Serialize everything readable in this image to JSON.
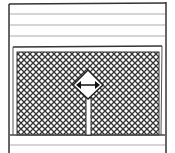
{
  "figure": {
    "handle_icon": "horizontal-resize-arrows-icon"
  },
  "colors": {
    "stroke": "#333333",
    "light_line": "#aaaaaa",
    "background": "#ffffff"
  }
}
